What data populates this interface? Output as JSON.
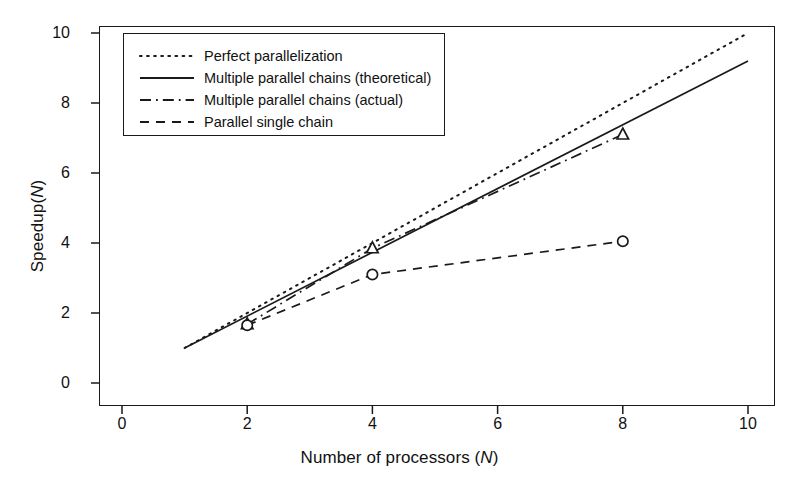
{
  "chart_data": {
    "type": "line",
    "title": "",
    "xlabel": "Number of processors (N)",
    "ylabel": "Speedup(N)",
    "xlabel_plain": "Number of processors (",
    "xlabel_italic": "N",
    "xlabel_tail": ")",
    "ylabel_plain": "Speedup(",
    "ylabel_italic": "N",
    "ylabel_tail": ")",
    "xlim": [
      0,
      10
    ],
    "ylim": [
      0,
      10
    ],
    "xticks": [
      0,
      2,
      4,
      6,
      8,
      10
    ],
    "yticks": [
      0,
      2,
      4,
      6,
      8,
      10
    ],
    "grid": false,
    "legend_position": "top-left inside",
    "series": [
      {
        "name": "Perfect parallelization",
        "style": "dotted",
        "marker": "none",
        "x": [
          1,
          10
        ],
        "y": [
          1,
          10
        ]
      },
      {
        "name": "Multiple parallel chains (theoretical)",
        "style": "solid",
        "marker": "none",
        "x": [
          1,
          10
        ],
        "y": [
          1,
          9.2
        ]
      },
      {
        "name": "Multiple parallel chains (actual)",
        "style": "dash-dot",
        "marker": "triangle",
        "x": [
          2,
          4,
          8
        ],
        "y": [
          1.68,
          3.85,
          7.1
        ]
      },
      {
        "name": "Parallel single chain",
        "style": "dashed",
        "marker": "circle",
        "x": [
          2,
          4,
          8
        ],
        "y": [
          1.65,
          3.1,
          4.05
        ]
      }
    ]
  },
  "legend": {
    "items": [
      {
        "label": "Perfect parallelization",
        "style": "dotted"
      },
      {
        "label": "Multiple parallel chains (theoretical)",
        "style": "solid"
      },
      {
        "label": "Multiple parallel chains (actual)",
        "style": "dash-dot"
      },
      {
        "label": "Parallel single chain",
        "style": "dashed"
      }
    ]
  }
}
